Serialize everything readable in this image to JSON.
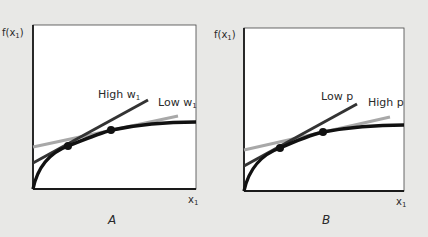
{
  "colors": {
    "background": "#e8e8e6",
    "plot_bg": "#ffffff",
    "axis": "#1a1a1a",
    "curve": "#111111",
    "dark_line": "#333333",
    "gray_line": "#a8a8a8"
  },
  "panels": [
    {
      "id": "A",
      "caption": "A",
      "y_label": "f(x",
      "y_label_sub": "1",
      "y_label_close": ")",
      "x_label": "x",
      "x_label_sub": "1",
      "dark_line_label": "High w",
      "dark_line_label_sub": "1",
      "gray_line_label": "Low w",
      "gray_line_label_sub": "1"
    },
    {
      "id": "B",
      "caption": "B",
      "y_label": "f(x",
      "y_label_sub": "1",
      "y_label_close": ")",
      "x_label": "x",
      "x_label_sub": "1",
      "dark_line_label": "Low p",
      "gray_line_label": "High p"
    }
  ]
}
